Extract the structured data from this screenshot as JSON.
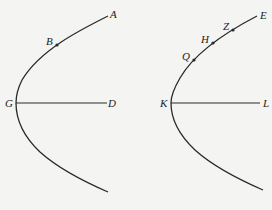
{
  "colors": {
    "background": "#f4f4f2",
    "stroke": "#2a2a2a"
  },
  "figures": [
    {
      "id": "left",
      "curve": "parabola",
      "vertex": {
        "label": "G",
        "x": 16,
        "y": 103
      },
      "axis_end": {
        "label": "D",
        "x": 107,
        "y": 103
      },
      "top_end": {
        "label": "A",
        "x": 108,
        "y": 16
      },
      "bottom_end": {
        "x": 108,
        "y": 192
      },
      "points": [
        {
          "label": "B",
          "x": 57,
          "y": 45
        }
      ]
    },
    {
      "id": "right",
      "curve": "parabola",
      "vertex": {
        "label": "K",
        "x": 171,
        "y": 103
      },
      "axis_end": {
        "label": "L",
        "x": 260,
        "y": 103
      },
      "top_end": {
        "label": "E",
        "x": 257,
        "y": 16
      },
      "bottom_end": {
        "x": 263,
        "y": 190
      },
      "points": [
        {
          "label": "Z",
          "x": 233,
          "y": 30
        },
        {
          "label": "H",
          "x": 213,
          "y": 43
        },
        {
          "label": "Q",
          "x": 194,
          "y": 60
        }
      ]
    }
  ],
  "labels": {
    "A": "A",
    "B": "B",
    "G": "G",
    "D": "D",
    "E": "E",
    "Z": "Z",
    "H": "H",
    "Q": "Q",
    "K": "K",
    "L": "L"
  }
}
